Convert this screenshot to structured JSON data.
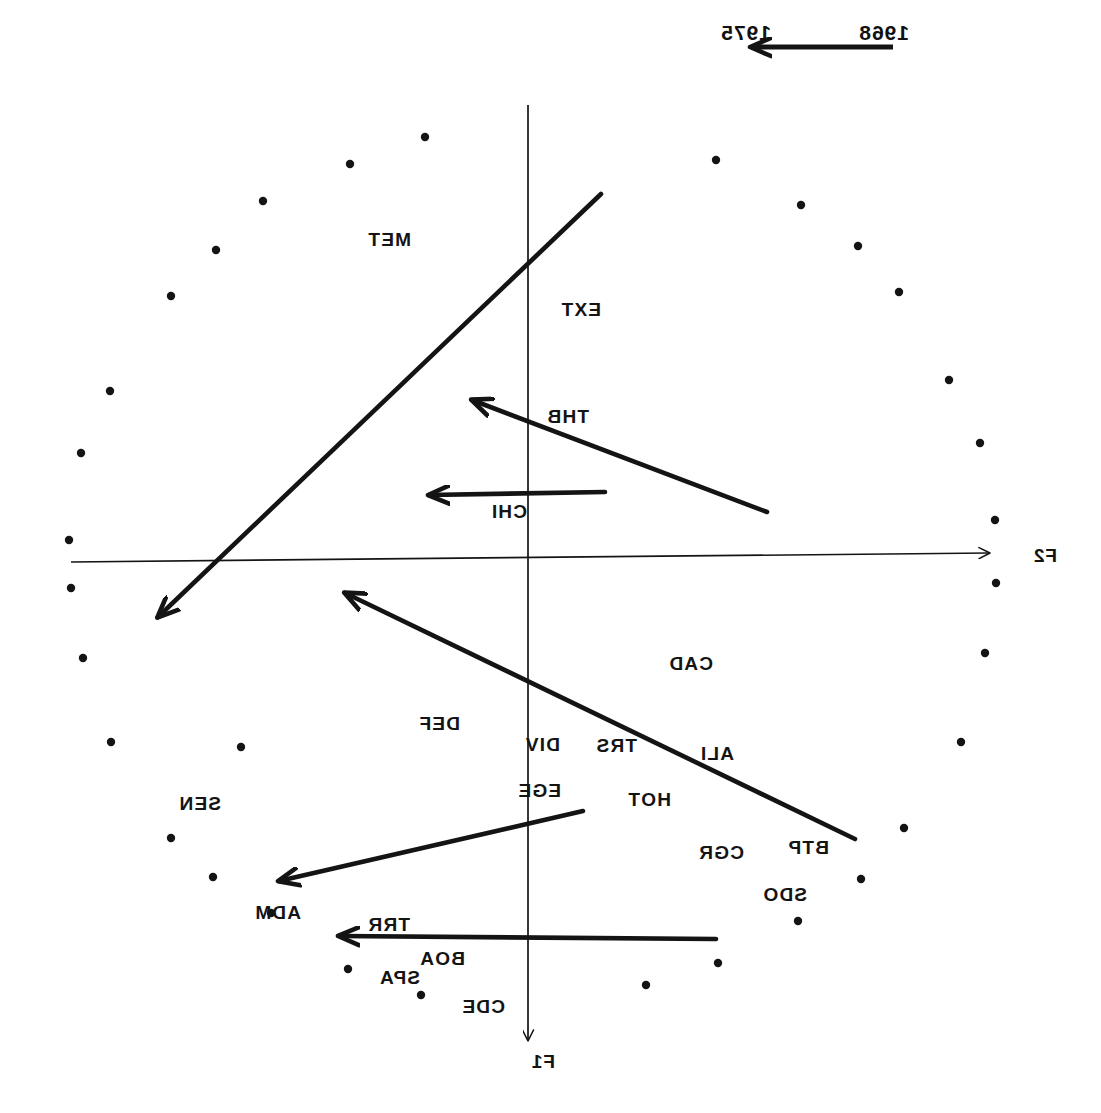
{
  "figure": {
    "type": "scatter",
    "orientation": "mirrored-horizontal",
    "background": "#ffffff",
    "ink": "#141414"
  },
  "axes": {
    "f1": {
      "label": "F1",
      "direction": "down",
      "x": 573,
      "y_top": 105,
      "y_bottom": 1040
    },
    "f2": {
      "label": "F2",
      "direction": "left",
      "y": 558,
      "x_left": 112,
      "x_right": 1030
    }
  },
  "legend": {
    "start_year": "1968",
    "end_year": "1975",
    "caption_note": "arrow runs 1968 -> 1975"
  },
  "point_labels": [
    {
      "text": "MET",
      "x": 690,
      "y": 230
    },
    {
      "text": "EXT",
      "x": 500,
      "y": 300
    },
    {
      "text": "THB",
      "x": 512,
      "y": 407
    },
    {
      "text": "CHI",
      "x": 574,
      "y": 502
    },
    {
      "text": "CAD",
      "x": 388,
      "y": 654
    },
    {
      "text": "DEF",
      "x": 641,
      "y": 714
    },
    {
      "text": "DIV",
      "x": 541,
      "y": 735
    },
    {
      "text": "TRS",
      "x": 464,
      "y": 736
    },
    {
      "text": "ALI",
      "x": 367,
      "y": 744
    },
    {
      "text": "HOT",
      "x": 430,
      "y": 790
    },
    {
      "text": "EGE",
      "x": 540,
      "y": 781
    },
    {
      "text": "SEN",
      "x": 880,
      "y": 794
    },
    {
      "text": "BTP",
      "x": 272,
      "y": 838
    },
    {
      "text": "CGR",
      "x": 357,
      "y": 843
    },
    {
      "text": "SDO",
      "x": 294,
      "y": 885
    },
    {
      "text": "ADM",
      "x": 800,
      "y": 903
    },
    {
      "text": "TRR",
      "x": 691,
      "y": 915
    },
    {
      "text": "BOA",
      "x": 636,
      "y": 949
    },
    {
      "text": "SPA",
      "x": 681,
      "y": 968
    },
    {
      "text": "CDE",
      "x": 596,
      "y": 997
    }
  ],
  "trajectory_arrows": [
    {
      "name": "met-ext-arrow",
      "x1": 500,
      "y1": 194,
      "x2": 943,
      "y2": 617
    },
    {
      "name": "thb-arrow",
      "x1": 334,
      "y1": 512,
      "x2": 629,
      "y2": 400
    },
    {
      "name": "chi-arrow",
      "x1": 496,
      "y1": 492,
      "x2": 672,
      "y2": 495
    },
    {
      "name": "cad-div-arrow",
      "x1": 246,
      "y1": 839,
      "x2": 756,
      "y2": 593
    },
    {
      "name": "adm-arrow",
      "x1": 518,
      "y1": 811,
      "x2": 822,
      "y2": 881
    },
    {
      "name": "trr-arrow",
      "x1": 385,
      "y1": 939,
      "x2": 762,
      "y2": 936
    }
  ],
  "scatter_points": [
    {
      "x": 676,
      "y": 137
    },
    {
      "x": 385,
      "y": 160
    },
    {
      "x": 751,
      "y": 164
    },
    {
      "x": 300,
      "y": 205
    },
    {
      "x": 838,
      "y": 201
    },
    {
      "x": 243,
      "y": 246
    },
    {
      "x": 885,
      "y": 250
    },
    {
      "x": 202,
      "y": 292
    },
    {
      "x": 930,
      "y": 296
    },
    {
      "x": 152,
      "y": 380
    },
    {
      "x": 991,
      "y": 391
    },
    {
      "x": 121,
      "y": 443
    },
    {
      "x": 1020,
      "y": 453
    },
    {
      "x": 106,
      "y": 520
    },
    {
      "x": 1032,
      "y": 540
    },
    {
      "x": 105,
      "y": 583
    },
    {
      "x": 1030,
      "y": 588
    },
    {
      "x": 116,
      "y": 653
    },
    {
      "x": 1018,
      "y": 658
    },
    {
      "x": 140,
      "y": 742
    },
    {
      "x": 990,
      "y": 742
    },
    {
      "x": 197,
      "y": 828
    },
    {
      "x": 930,
      "y": 838
    },
    {
      "x": 240,
      "y": 879
    },
    {
      "x": 888,
      "y": 877
    },
    {
      "x": 303,
      "y": 921
    },
    {
      "x": 830,
      "y": 913
    },
    {
      "x": 383,
      "y": 963
    },
    {
      "x": 753,
      "y": 969
    },
    {
      "x": 455,
      "y": 985
    },
    {
      "x": 680,
      "y": 995
    },
    {
      "x": 860,
      "y": 747
    }
  ]
}
